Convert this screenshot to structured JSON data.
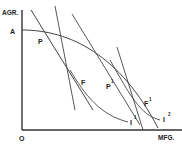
{
  "diagram": {
    "axes": {
      "y_label": "AGR.",
      "x_label": "MFG.",
      "origin_label": "O",
      "intercept_label": "A"
    },
    "points": [
      {
        "id": "P",
        "label": "P"
      },
      {
        "id": "F",
        "label": "F"
      },
      {
        "id": "P1",
        "label": "P",
        "sup": "1"
      },
      {
        "id": "F1",
        "label": "F",
        "sup": "1"
      }
    ],
    "curves": [
      {
        "id": "I1",
        "label": "I",
        "sup": "1"
      },
      {
        "id": "I2",
        "label": "I",
        "sup": "2"
      }
    ],
    "colors": {
      "line": "#333333",
      "text": "#222222",
      "background": "#ffffff"
    }
  }
}
